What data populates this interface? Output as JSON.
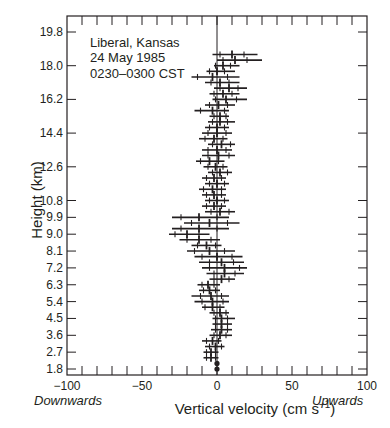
{
  "chart_data": {
    "type": "scatter",
    "subtype": "horizontal-errorbar-profile",
    "title": "",
    "annotation": {
      "location": "Liberal, Kansas",
      "date": "24 May 1985",
      "time": "0230–0300 CST"
    },
    "xlabel": "Vertical velocity (cm s⁻¹)",
    "xlabel_main": "Vertical velocity (cm s",
    "xlabel_sup": "−1",
    "xlabel_close": ")",
    "ylabel": "Height (km)",
    "xlim": [
      -100,
      100
    ],
    "ylim": [
      1.8,
      20.4
    ],
    "x_ticks": [
      -100,
      -50,
      0,
      50,
      100
    ],
    "x_tick_labels": [
      "−100",
      "−50",
      "0",
      "50",
      "100"
    ],
    "x_minor_step": 10,
    "y_ticks": [
      1.8,
      2.7,
      3.6,
      4.5,
      5.4,
      6.3,
      7.2,
      8.1,
      9.0,
      9.9,
      10.8,
      12.6,
      14.4,
      16.2,
      18.0,
      19.8
    ],
    "y_tick_labels": [
      "1.8",
      "2.7",
      "3.6",
      "4.5",
      "5.4",
      "6.3",
      "7.2",
      "8.1",
      "9.0",
      "9.9",
      "10.8",
      "12.6",
      "14.4",
      "16.2",
      "18.0",
      "19.8"
    ],
    "x_direction_labels": {
      "left": "Downwards",
      "right": "Upwards"
    },
    "zero_line": true,
    "grid": false,
    "legend": null,
    "series": [
      {
        "name": "Vertical velocity profile",
        "points": [
          {
            "h": 18.6,
            "mean": 10,
            "std": 8,
            "min": -3,
            "max": 27
          },
          {
            "h": 18.3,
            "mean": 12,
            "std": 8,
            "min": 0,
            "max": 30
          },
          {
            "h": 18.0,
            "mean": 4,
            "std": 5,
            "min": -2,
            "max": 15
          },
          {
            "h": 17.7,
            "mean": 0,
            "std": 5,
            "min": -7,
            "max": 12
          },
          {
            "h": 17.4,
            "mean": -3,
            "std": 10,
            "min": -17,
            "max": 15
          },
          {
            "h": 17.1,
            "mean": 2,
            "std": 6,
            "min": -8,
            "max": 15
          },
          {
            "h": 16.8,
            "mean": 8,
            "std": 6,
            "min": -2,
            "max": 20
          },
          {
            "h": 16.5,
            "mean": 4,
            "std": 6,
            "min": -5,
            "max": 15
          },
          {
            "h": 16.2,
            "mean": 6,
            "std": 7,
            "min": -3,
            "max": 20
          },
          {
            "h": 15.9,
            "mean": 1,
            "std": 6,
            "min": -8,
            "max": 12
          },
          {
            "h": 15.6,
            "mean": -3,
            "std": 8,
            "min": -15,
            "max": 8
          },
          {
            "h": 15.3,
            "mean": 2,
            "std": 4,
            "min": -5,
            "max": 8
          },
          {
            "h": 15.0,
            "mean": 2,
            "std": 5,
            "min": -6,
            "max": 12
          },
          {
            "h": 14.7,
            "mean": 0,
            "std": 5,
            "min": -8,
            "max": 8
          },
          {
            "h": 14.4,
            "mean": 0,
            "std": 6,
            "min": -10,
            "max": 10
          },
          {
            "h": 14.1,
            "mean": -2,
            "std": 6,
            "min": -12,
            "max": 7
          },
          {
            "h": 13.8,
            "mean": 3,
            "std": 6,
            "min": -6,
            "max": 12
          },
          {
            "h": 13.5,
            "mean": 0,
            "std": 6,
            "min": -10,
            "max": 10
          },
          {
            "h": 13.2,
            "mean": 1,
            "std": 7,
            "min": -10,
            "max": 12
          },
          {
            "h": 12.9,
            "mean": -5,
            "std": 6,
            "min": -14,
            "max": 5
          },
          {
            "h": 12.6,
            "mean": -1,
            "std": 5,
            "min": -9,
            "max": 7
          },
          {
            "h": 12.3,
            "mean": 2,
            "std": 5,
            "min": -6,
            "max": 10
          },
          {
            "h": 12.0,
            "mean": -2,
            "std": 5,
            "min": -10,
            "max": 6
          },
          {
            "h": 11.7,
            "mean": 0,
            "std": 5,
            "min": -8,
            "max": 8
          },
          {
            "h": 11.4,
            "mean": -3,
            "std": 6,
            "min": -12,
            "max": 6
          },
          {
            "h": 11.1,
            "mean": -2,
            "std": 5,
            "min": -10,
            "max": 6
          },
          {
            "h": 10.8,
            "mean": 0,
            "std": 5,
            "min": -8,
            "max": 8
          },
          {
            "h": 10.5,
            "mean": -2,
            "std": 5,
            "min": -10,
            "max": 6
          },
          {
            "h": 10.2,
            "mean": 2,
            "std": 6,
            "min": -8,
            "max": 12
          },
          {
            "h": 9.9,
            "mean": -12,
            "std": 12,
            "min": -30,
            "max": 8
          },
          {
            "h": 9.6,
            "mean": -5,
            "std": 12,
            "min": -22,
            "max": 15
          },
          {
            "h": 9.3,
            "mean": -12,
            "std": 12,
            "min": -30,
            "max": 8
          },
          {
            "h": 9.0,
            "mean": -20,
            "std": 8,
            "min": -32,
            "max": -5
          },
          {
            "h": 8.7,
            "mean": -12,
            "std": 8,
            "min": -25,
            "max": 2
          },
          {
            "h": 8.4,
            "mean": -7,
            "std": 6,
            "min": -17,
            "max": 3
          },
          {
            "h": 8.1,
            "mean": -5,
            "std": 10,
            "min": -20,
            "max": 12
          },
          {
            "h": 7.8,
            "mean": 0,
            "std": 10,
            "min": -15,
            "max": 17
          },
          {
            "h": 7.5,
            "mean": 3,
            "std": 8,
            "min": -12,
            "max": 18
          },
          {
            "h": 7.2,
            "mean": 5,
            "std": 10,
            "min": -10,
            "max": 20
          },
          {
            "h": 6.9,
            "mean": 5,
            "std": 7,
            "min": -7,
            "max": 18
          },
          {
            "h": 6.6,
            "mean": 3,
            "std": 5,
            "min": -5,
            "max": 12
          },
          {
            "h": 6.3,
            "mean": -6,
            "std": 4,
            "min": -13,
            "max": 2
          },
          {
            "h": 6.0,
            "mean": -5,
            "std": 4,
            "min": -12,
            "max": 2
          },
          {
            "h": 5.7,
            "mean": -4,
            "std": 7,
            "min": -17,
            "max": 8
          },
          {
            "h": 5.4,
            "mean": -3,
            "std": 7,
            "min": -15,
            "max": 8
          },
          {
            "h": 5.1,
            "mean": -3,
            "std": 5,
            "min": -10,
            "max": 5
          },
          {
            "h": 4.8,
            "mean": 2,
            "std": 4,
            "min": -5,
            "max": 8
          },
          {
            "h": 4.5,
            "mean": 3,
            "std": 4,
            "min": -3,
            "max": 12
          },
          {
            "h": 4.2,
            "mean": 3,
            "std": 4,
            "min": -3,
            "max": 10
          },
          {
            "h": 3.9,
            "mean": 3,
            "std": 4,
            "min": -4,
            "max": 10
          },
          {
            "h": 3.6,
            "mean": 2,
            "std": 4,
            "min": -5,
            "max": 10
          },
          {
            "h": 3.3,
            "mean": -3,
            "std": 4,
            "min": -10,
            "max": 3
          },
          {
            "h": 3.0,
            "mean": -1,
            "std": 4,
            "min": -8,
            "max": 5
          },
          {
            "h": 2.7,
            "mean": -4,
            "std": 3,
            "min": -9,
            "max": 1
          },
          {
            "h": 2.4,
            "mean": -4,
            "std": 3,
            "min": -9,
            "max": 1
          },
          {
            "h": 2.1,
            "mean": 0,
            "std": 0,
            "min": 0,
            "max": 0
          },
          {
            "h": 1.8,
            "mean": 0,
            "std": 0,
            "min": 0,
            "max": 0
          }
        ]
      }
    ]
  },
  "colors": {
    "ink": "#231f20",
    "background": "#ffffff"
  }
}
